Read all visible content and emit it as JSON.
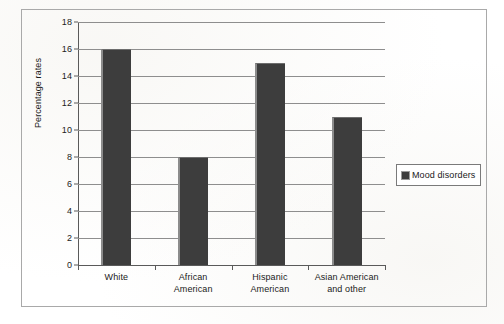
{
  "chart_data": {
    "type": "bar",
    "title": "",
    "xlabel": "",
    "ylabel": "Percentage rates",
    "ylim": [
      0,
      18
    ],
    "ytick_step": 2,
    "yticks": [
      "18",
      "16",
      "14",
      "12",
      "10",
      "8",
      "6",
      "4",
      "2",
      "0"
    ],
    "grid": true,
    "legend_position": "right",
    "categories": [
      "White",
      "African American",
      "Hispanic American",
      "Asian American and other"
    ],
    "category_label_lines": [
      [
        "White"
      ],
      [
        "African",
        "American"
      ],
      [
        "Hispanic",
        "American"
      ],
      [
        "Asian American",
        "and other"
      ]
    ],
    "series": [
      {
        "name": "Mood disorders",
        "values": [
          16,
          8,
          15,
          11
        ],
        "color": "#3d3d3d"
      }
    ]
  },
  "legend": {
    "entries": [
      {
        "label": "Mood disorders",
        "swatch_name": "mood-disorders-swatch"
      }
    ]
  },
  "colors": {
    "bar_fill": "#3d3d3d",
    "bar_edge": "#8c8c8c",
    "gridline": "#8e8e8e",
    "axis": "#5a5a5a",
    "frame": "#a9a9a9",
    "text": "#1a1a1a",
    "background": "#ffffff"
  }
}
